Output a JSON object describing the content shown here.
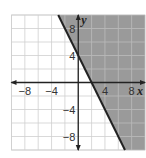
{
  "chart_data": {
    "type": "line",
    "title": "",
    "xlabel": "x",
    "ylabel": "y",
    "xlim": [
      -10,
      10
    ],
    "ylim": [
      -10,
      10
    ],
    "grid": true,
    "grid_step": 2,
    "x_ticks": [
      {
        "value": -8,
        "label": "−8"
      },
      {
        "value": -4,
        "label": "−4"
      },
      {
        "value": 4,
        "label": "4"
      },
      {
        "value": 8,
        "label": "8"
      }
    ],
    "y_ticks": [
      {
        "value": 8,
        "label": "8"
      },
      {
        "value": 4,
        "label": "4"
      },
      {
        "value": -4,
        "label": "−4"
      },
      {
        "value": -8,
        "label": "−8"
      }
    ],
    "series": [
      {
        "name": "boundary line",
        "equation": "y = -2x + 4",
        "style": "solid",
        "points": [
          {
            "x": -3,
            "y": 10
          },
          {
            "x": 0,
            "y": 4
          },
          {
            "x": 2,
            "y": 0
          },
          {
            "x": 7,
            "y": -10
          }
        ]
      }
    ],
    "shaded_region": {
      "inequality": "y ≥ -2x + 4",
      "side": "right of line",
      "color": "#9a9a9a"
    },
    "colors": {
      "grid_line": "#cfcfcf",
      "shade": "#9a9a9a",
      "shade_grid_line": "#b8b8b8",
      "axis": "#222222",
      "boundary": "#222222"
    }
  }
}
